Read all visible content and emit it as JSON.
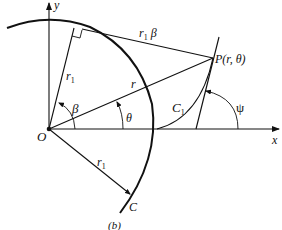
{
  "figure": {
    "caption": "(b)",
    "axes": {
      "x_label": "x",
      "y_label": "y"
    },
    "origin_label": "O",
    "point": {
      "label": "P(r, θ)"
    },
    "labels": {
      "radius_upper": "r",
      "radius_upper_sub": "1",
      "radius_lower": "r",
      "radius_lower_sub": "1",
      "arc_length_r": "r",
      "arc_length_sub": "1",
      "arc_length_beta": "β",
      "radius_vector": "r",
      "angle_beta": "β",
      "angle_theta": "θ",
      "angle_psi": "ψ",
      "curve_c": "C",
      "curve_c1": "C",
      "curve_c1_sub": "1"
    }
  }
}
